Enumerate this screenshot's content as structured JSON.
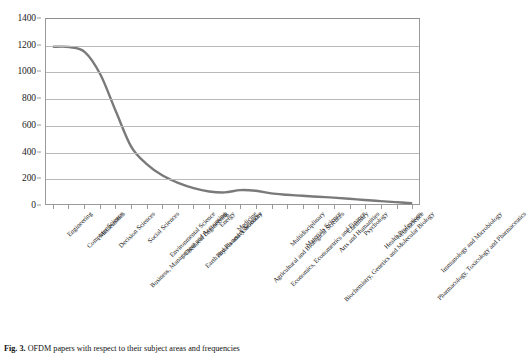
{
  "caption": {
    "figure_number": "Fig. 3.",
    "text": "OFDM papers with respect to their subject areas and frequencies"
  },
  "chart_data": {
    "type": "line",
    "title": "",
    "xlabel": "",
    "ylabel": "",
    "ylim": [
      0,
      1400
    ],
    "ytick_values": [
      0,
      200,
      400,
      600,
      800,
      1000,
      1200,
      1400
    ],
    "ytick_labels": [
      "0",
      "200",
      "400",
      "600",
      "800",
      "1000",
      "1200",
      "1400"
    ],
    "grid": true,
    "legend": "none",
    "line_color": "#7a7a7a",
    "line_width": 2.4,
    "categories": [
      "Engineering",
      "Computer Science",
      "Mathematics",
      "Decision Sciences",
      "Business, Management and Accounting",
      "Social Sciences",
      "Environmental Science",
      "Chemical Engineering",
      "Earth and Planetary Sciences",
      "Physics and Astronomy",
      "Energy",
      "Medicine",
      "Agricultural and Biological Sciences",
      "Economics, Econometrics and Finance",
      "Multidisciplinary",
      "Materials Science",
      "Biochemistry, Genetics and Molecular Biology",
      "Arts and Humanities",
      "Chemistry",
      "Psychology",
      "Health Professions",
      "Neuroscience",
      "Pharmacology, Toxicology and Pharmaceutics",
      "Immunology and Microbiology"
    ],
    "values": [
      1190,
      1188,
      1150,
      980,
      700,
      430,
      300,
      215,
      160,
      120,
      95,
      88,
      105,
      100,
      80,
      70,
      62,
      55,
      48,
      40,
      30,
      22,
      14,
      6
    ]
  }
}
